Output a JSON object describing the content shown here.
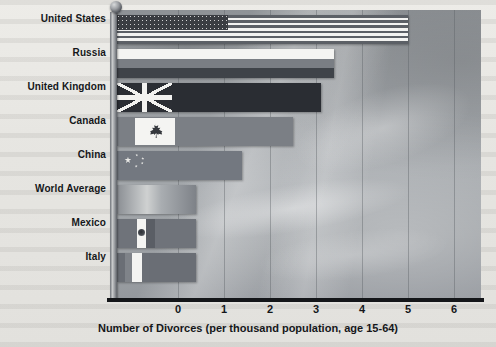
{
  "chart_data": {
    "type": "bar",
    "orientation": "horizontal",
    "title": "",
    "xlabel": "Number of Divorces (per thousand population, age 15-64)",
    "ylabel": "",
    "xlim": [
      0,
      6.6
    ],
    "xticks": [
      0,
      1,
      2,
      3,
      4,
      5,
      6
    ],
    "xtick_labels": [
      "0",
      "1",
      "2",
      "3",
      "4",
      "5",
      "6"
    ],
    "grid": "vertical",
    "legend": "none",
    "categories": [
      "United States",
      "Russia",
      "United Kingdom",
      "Canada",
      "China",
      "World Average",
      "Mexico",
      "Italy"
    ],
    "values": [
      5.0,
      3.4,
      3.1,
      2.5,
      1.4,
      0.4,
      0.4,
      0.4
    ],
    "bar_fill": "national flag imagery (grayscale)",
    "flags": [
      "united-states-flag",
      "russia-flag",
      "united-kingdom-flag",
      "canada-flag",
      "china-flag",
      "none",
      "mexico-flag",
      "italy-flag"
    ],
    "background": "grayscale photographic sky with clouds",
    "axis_style": "y-axis drawn as a flagpole with a spherical finial"
  },
  "colors": {
    "page_background": "#e9e8e4",
    "plot_background": "#9a9ea2",
    "axis": "#141619",
    "gridline": "#5a5f64",
    "text": "#15171a",
    "flag_light": "#f4f4f2",
    "flag_dark": "#3a3d42"
  },
  "icons": {
    "finial": "sphere-finial-icon",
    "maple_leaf": "maple-leaf-icon",
    "china_stars": "five-stars-icon",
    "mexico_emblem": "eagle-emblem-icon"
  }
}
